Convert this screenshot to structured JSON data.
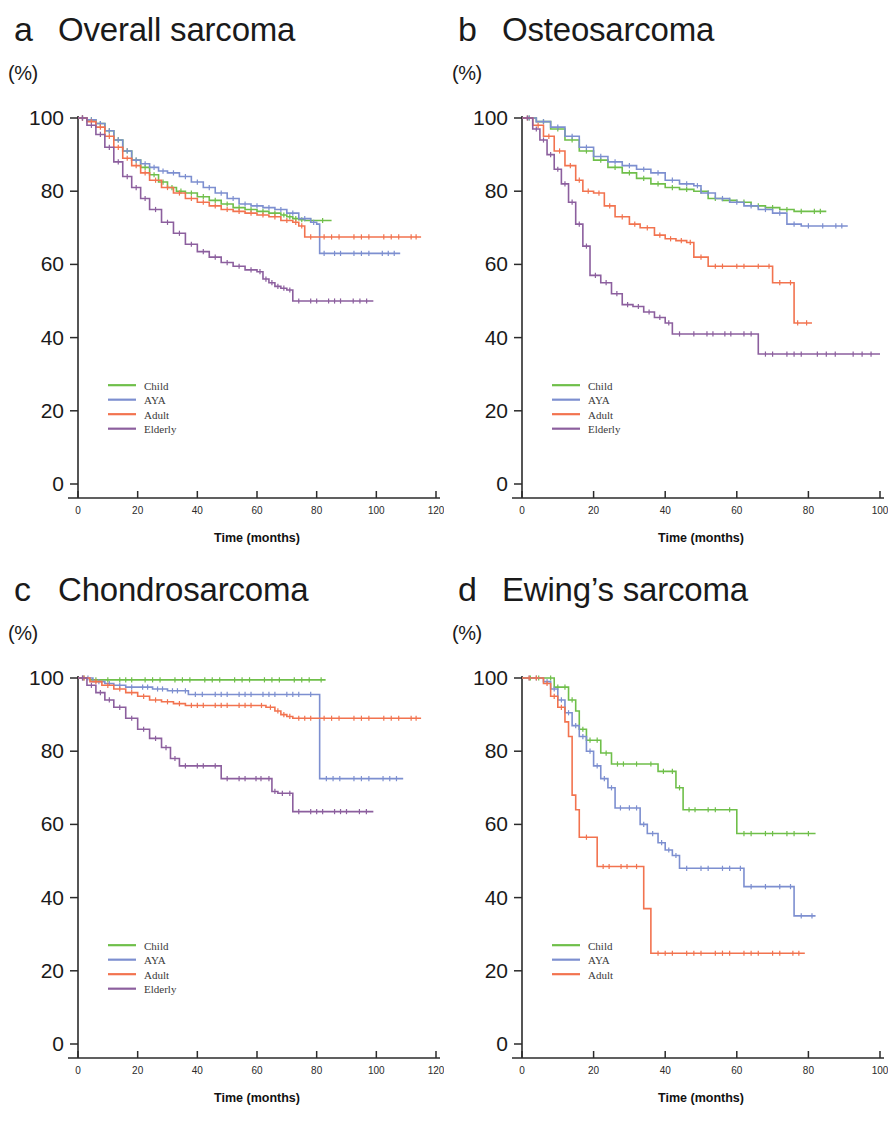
{
  "figure": {
    "axis_x_title": "Time (months)",
    "axis_y_unit": "(%)",
    "series_colors": {
      "Child": "#6fbf4a",
      "AYA": "#7d8fd0",
      "Adult": "#f2734f",
      "Elderly": "#8c5f9e"
    }
  },
  "panels": [
    {
      "letter": "a",
      "title": "Overall sarcoma",
      "legend": [
        "Child",
        "AYA",
        "Adult",
        "Elderly"
      ]
    },
    {
      "letter": "b",
      "title": "Osteosarcoma",
      "legend": [
        "Child",
        "AYA",
        "Adult",
        "Elderly"
      ]
    },
    {
      "letter": "c",
      "title": "Chondrosarcoma",
      "legend": [
        "Child",
        "AYA",
        "Adult",
        "Elderly"
      ]
    },
    {
      "letter": "d",
      "title": "Ewing’s sarcoma",
      "legend": [
        "Child",
        "AYA",
        "Adult"
      ]
    }
  ],
  "chart_data": [
    {
      "type": "line",
      "panel": "a",
      "title": "Overall sarcoma",
      "xlabel": "Time (months)",
      "ylabel": "(%)",
      "xlim": [
        0,
        120
      ],
      "ylim": [
        0,
        100
      ],
      "xticks": [
        0,
        20,
        40,
        60,
        80,
        100,
        120
      ],
      "yticks": [
        0,
        20,
        40,
        60,
        80,
        100
      ],
      "grid": false,
      "legend_position": "lower-left",
      "series": [
        {
          "name": "Child",
          "color": "#6fbf4a",
          "x": [
            0,
            3,
            6,
            9,
            12,
            15,
            18,
            21,
            24,
            27,
            30,
            33,
            36,
            40,
            44,
            48,
            52,
            56,
            60,
            64,
            68,
            70,
            72,
            74,
            76,
            80,
            84,
            85
          ],
          "values": [
            100,
            99.5,
            98.5,
            96.5,
            94,
            91,
            88.5,
            86.5,
            84.5,
            82.5,
            81,
            80,
            79.5,
            78.5,
            77.5,
            76.5,
            75.5,
            75,
            74.5,
            74,
            73.5,
            73,
            72.5,
            72.2,
            72,
            72,
            72,
            72
          ]
        },
        {
          "name": "AYA",
          "color": "#7d8fd0",
          "x": [
            0,
            3,
            6,
            9,
            12,
            15,
            18,
            21,
            24,
            27,
            30,
            34,
            38,
            42,
            46,
            50,
            54,
            58,
            62,
            66,
            70,
            74,
            78,
            80,
            81,
            84,
            90,
            100,
            108
          ],
          "values": [
            100,
            99.5,
            98.5,
            96.5,
            94,
            91,
            88.5,
            87.5,
            86.5,
            85.5,
            85,
            84,
            82.5,
            81,
            79.5,
            78,
            76.5,
            76,
            75.5,
            75,
            74,
            72.5,
            71.5,
            71,
            63,
            63,
            63,
            63,
            63
          ]
        },
        {
          "name": "Adult",
          "color": "#f2734f",
          "x": [
            0,
            3,
            6,
            9,
            12,
            15,
            18,
            21,
            24,
            28,
            32,
            36,
            40,
            44,
            48,
            52,
            56,
            60,
            64,
            68,
            72,
            74,
            76,
            80,
            90,
            100,
            110,
            115
          ],
          "values": [
            100,
            99,
            97.5,
            95,
            92,
            89,
            87,
            85,
            83,
            81,
            79.5,
            78,
            77,
            76,
            75,
            74.5,
            74,
            73.5,
            73,
            72,
            71.5,
            70.5,
            67.5,
            67.5,
            67.5,
            67.5,
            67.5,
            67.5
          ]
        },
        {
          "name": "Elderly",
          "color": "#8c5f9e",
          "x": [
            0,
            3,
            6,
            9,
            12,
            15,
            18,
            21,
            24,
            28,
            32,
            36,
            40,
            44,
            48,
            52,
            56,
            60,
            62,
            64,
            66,
            68,
            70,
            72,
            76,
            82,
            90,
            99
          ],
          "values": [
            100,
            98,
            95.5,
            92,
            88,
            84,
            81,
            78,
            75,
            71.5,
            68.5,
            65.5,
            63.5,
            62,
            60.5,
            59.5,
            58.5,
            58,
            56,
            55,
            54,
            53.5,
            53,
            50,
            50,
            50,
            50,
            50
          ]
        }
      ]
    },
    {
      "type": "line",
      "panel": "b",
      "title": "Osteosarcoma",
      "xlabel": "Time (months)",
      "ylabel": "(%)",
      "xlim": [
        0,
        100
      ],
      "ylim": [
        0,
        100
      ],
      "xticks": [
        0,
        20,
        40,
        60,
        80,
        100
      ],
      "yticks": [
        0,
        20,
        40,
        60,
        80,
        100
      ],
      "grid": false,
      "legend_position": "lower-left",
      "series": [
        {
          "name": "Child",
          "color": "#6fbf4a",
          "x": [
            0,
            4,
            8,
            12,
            16,
            20,
            24,
            28,
            32,
            36,
            40,
            44,
            48,
            52,
            56,
            60,
            64,
            68,
            72,
            76,
            80,
            85
          ],
          "values": [
            100,
            99,
            97,
            94,
            91,
            88.5,
            86.5,
            85,
            83.5,
            82,
            81,
            80.5,
            80,
            78,
            77.5,
            77,
            76,
            75.5,
            75,
            74.5,
            74.5,
            74.5
          ]
        },
        {
          "name": "AYA",
          "color": "#7d8fd0",
          "x": [
            0,
            4,
            8,
            12,
            16,
            20,
            24,
            28,
            32,
            36,
            40,
            44,
            48,
            50,
            54,
            58,
            62,
            66,
            70,
            74,
            78,
            82,
            86,
            91
          ],
          "values": [
            100,
            99,
            97.5,
            95,
            92,
            89.5,
            88,
            87,
            86,
            85,
            83,
            82,
            81.5,
            79.5,
            78,
            77,
            76,
            75,
            74,
            71,
            70.5,
            70.5,
            70.5,
            70.5
          ]
        },
        {
          "name": "Adult",
          "color": "#f2734f",
          "x": [
            0,
            3,
            6,
            9,
            12,
            15,
            17,
            20,
            23,
            26,
            30,
            33,
            37,
            40,
            43,
            46,
            48,
            52,
            58,
            64,
            68,
            70,
            74,
            76,
            78,
            81
          ],
          "values": [
            100,
            98,
            95,
            91,
            87,
            83,
            80,
            79.5,
            76,
            73,
            71,
            70,
            68,
            67,
            66.5,
            66,
            62,
            59.5,
            59.5,
            59.5,
            59.5,
            55,
            55,
            44,
            44,
            44
          ]
        },
        {
          "name": "Elderly",
          "color": "#8c5f9e",
          "x": [
            0,
            3,
            5,
            7,
            9,
            11,
            13,
            15,
            17,
            19,
            22,
            25,
            28,
            31,
            34,
            37,
            40,
            42,
            46,
            50,
            55,
            60,
            66,
            72,
            80,
            90,
            100
          ],
          "values": [
            100,
            97,
            94,
            90,
            86,
            82,
            77,
            71,
            65,
            57,
            55,
            52,
            49,
            48.5,
            47,
            45.5,
            44,
            41,
            41,
            41,
            41,
            41,
            35.5,
            35.5,
            35.5,
            35.5,
            35.5
          ]
        }
      ]
    },
    {
      "type": "line",
      "panel": "c",
      "title": "Chondrosarcoma",
      "xlabel": "Time (months)",
      "ylabel": "(%)",
      "xlim": [
        0,
        120
      ],
      "ylim": [
        0,
        100
      ],
      "xticks": [
        0,
        20,
        40,
        60,
        80,
        100,
        120
      ],
      "yticks": [
        0,
        20,
        40,
        60,
        80,
        100
      ],
      "grid": false,
      "legend_position": "lower-left",
      "series": [
        {
          "name": "Child",
          "color": "#6fbf4a",
          "x": [
            0,
            4,
            8,
            12,
            20,
            30,
            40,
            50,
            60,
            70,
            80,
            83
          ],
          "values": [
            100,
            99.5,
            99.5,
            99.5,
            99.5,
            99.5,
            99.5,
            99.5,
            99.5,
            99.5,
            99.5,
            99.5
          ]
        },
        {
          "name": "AYA",
          "color": "#7d8fd0",
          "x": [
            0,
            5,
            9,
            12,
            16,
            20,
            25,
            30,
            35,
            37,
            44,
            52,
            60,
            68,
            76,
            80,
            81,
            90,
            100,
            109
          ],
          "values": [
            100,
            99,
            98.5,
            98,
            97.5,
            97.5,
            97,
            96.5,
            96.5,
            95.5,
            95.5,
            95.5,
            95.5,
            95.5,
            95.5,
            95.5,
            72.5,
            72.5,
            72.5,
            72.5
          ]
        },
        {
          "name": "Adult",
          "color": "#f2734f",
          "x": [
            0,
            4,
            8,
            12,
            16,
            20,
            24,
            28,
            32,
            36,
            44,
            52,
            60,
            63,
            66,
            68,
            70,
            72,
            80,
            90,
            100,
            110,
            115
          ],
          "values": [
            100,
            99,
            98,
            97,
            96,
            95,
            94,
            93.5,
            93,
            92.5,
            92.5,
            92.5,
            92.5,
            92,
            91,
            90,
            89.5,
            89,
            89,
            89,
            89,
            89,
            89
          ]
        },
        {
          "name": "Elderly",
          "color": "#8c5f9e",
          "x": [
            0,
            3,
            6,
            9,
            12,
            16,
            20,
            24,
            28,
            31,
            34,
            38,
            44,
            48,
            52,
            58,
            63,
            65,
            67,
            70,
            72,
            76,
            84,
            92,
            99
          ],
          "values": [
            100,
            98,
            96,
            94,
            92,
            89,
            86,
            83.5,
            81,
            78,
            76,
            76,
            76,
            72.5,
            72.5,
            72.5,
            72.5,
            69,
            68.5,
            68.5,
            63.5,
            63.5,
            63.5,
            63.5,
            63.5
          ]
        }
      ]
    },
    {
      "type": "line",
      "panel": "d",
      "title": "Ewing’s sarcoma",
      "xlabel": "Time (months)",
      "ylabel": "(%)",
      "xlim": [
        0,
        100
      ],
      "ylim": [
        0,
        100
      ],
      "xticks": [
        0,
        20,
        40,
        60,
        80,
        100
      ],
      "yticks": [
        0,
        20,
        40,
        60,
        80,
        100
      ],
      "grid": false,
      "legend_position": "lower-left",
      "series": [
        {
          "name": "Child",
          "color": "#6fbf4a",
          "x": [
            0,
            7,
            9,
            11,
            13,
            15,
            16,
            18,
            20,
            22,
            25,
            30,
            34,
            38,
            41,
            43,
            45,
            50,
            56,
            60,
            66,
            72,
            78,
            82
          ],
          "values": [
            100,
            100,
            97.5,
            97.5,
            94,
            91,
            86,
            83,
            83,
            79.5,
            76.5,
            76.5,
            76.5,
            74.5,
            74.5,
            70,
            64,
            64,
            64,
            57.5,
            57.5,
            57.5,
            57.5,
            57.5
          ]
        },
        {
          "name": "AYA",
          "color": "#7d8fd0",
          "x": [
            0,
            6,
            8,
            10,
            12,
            14,
            16,
            18,
            20,
            22,
            24,
            26,
            29,
            31,
            33,
            35,
            38,
            40,
            42,
            44,
            48,
            54,
            60,
            62,
            66,
            70,
            74,
            76,
            80,
            82
          ],
          "values": [
            100,
            99,
            97,
            94,
            90.5,
            87,
            84,
            80,
            76,
            72.5,
            70,
            64.5,
            64.5,
            64.5,
            60,
            57.5,
            55,
            53,
            51.5,
            48,
            48,
            48,
            48,
            43,
            43,
            43,
            43,
            35,
            35,
            35
          ]
        },
        {
          "name": "Adult",
          "color": "#f2734f",
          "x": [
            0,
            6,
            8,
            10,
            12,
            13,
            14,
            15,
            16,
            20,
            21,
            26,
            31,
            33,
            34,
            35,
            36,
            44,
            52,
            60,
            68,
            74,
            79
          ],
          "values": [
            100,
            98.5,
            95,
            92,
            88,
            84,
            68,
            64,
            56.5,
            56.5,
            48.5,
            48.5,
            48.5,
            48.5,
            37,
            37,
            24.8,
            24.8,
            24.8,
            24.8,
            24.8,
            24.8,
            24.8
          ]
        }
      ]
    }
  ]
}
